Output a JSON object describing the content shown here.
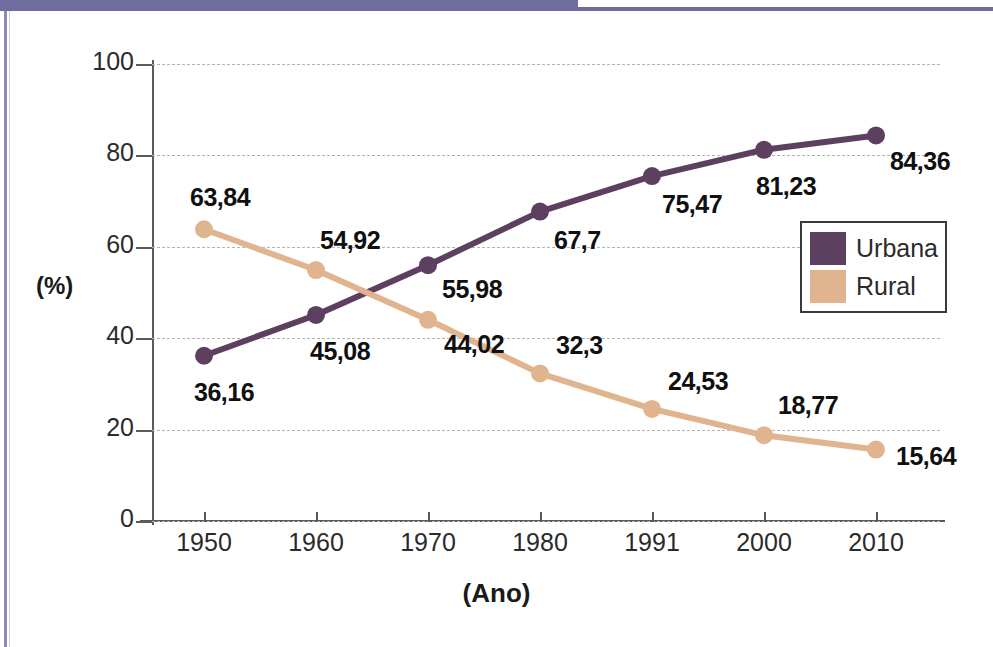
{
  "page": {
    "accent_band_color": "#6f6d9e",
    "side_rule_color": "#8b89b5",
    "background": "#ffffff"
  },
  "chart_data": {
    "type": "line",
    "title": "",
    "xlabel": "(Ano)",
    "ylabel": "(%)",
    "categories": [
      "1950",
      "1960",
      "1970",
      "1980",
      "1991",
      "2000",
      "2010"
    ],
    "ylim": [
      0,
      100
    ],
    "yticks": [
      "0",
      "20",
      "40",
      "60",
      "80",
      "100"
    ],
    "grid": true,
    "legend_position": "right",
    "series": [
      {
        "name": "Urbana",
        "color": "#5d3f5f",
        "values": [
          36.16,
          45.08,
          55.98,
          67.7,
          75.47,
          81.23,
          84.36
        ],
        "labels": [
          "36,16",
          "45,08",
          "55,98",
          "67,7",
          "75,47",
          "81,23",
          "84,36"
        ]
      },
      {
        "name": "Rural",
        "color": "#e0b48e",
        "values": [
          63.84,
          54.92,
          44.02,
          32.3,
          24.53,
          18.77,
          15.64
        ],
        "labels": [
          "63,84",
          "54,92",
          "44,02",
          "32,3",
          "24,53",
          "18,77",
          "15,64"
        ]
      }
    ]
  },
  "legend": {
    "items": [
      {
        "label": "Urbana",
        "color": "#5d3f5f"
      },
      {
        "label": "Rural",
        "color": "#e0b48e"
      }
    ]
  }
}
